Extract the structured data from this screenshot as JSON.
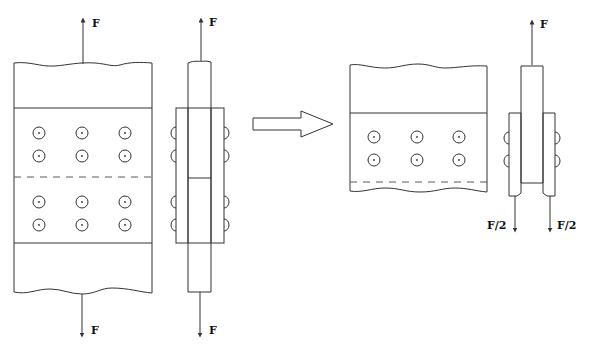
{
  "diagram": {
    "labels": {
      "top_force_left": "F",
      "top_force_side": "F",
      "bottom_force_left": "F",
      "bottom_force_side": "F",
      "top_force_right_side": "F",
      "half_force_left": "F/2",
      "half_force_right": "F/2"
    },
    "left_plan_view": {
      "bolt_rows": 4,
      "bolt_columns": 3,
      "bolts_total": 12
    },
    "left_side_view": {
      "bolt_heads_per_side": 4
    },
    "right_plan_view": {
      "bolt_rows": 2,
      "bolt_columns": 3,
      "bolts_total": 6
    },
    "right_side_view": {
      "bolt_heads_per_side": 2
    },
    "transition": "hollow-right-arrow",
    "colors": {
      "stroke": "#333333",
      "background": "#ffffff"
    }
  }
}
